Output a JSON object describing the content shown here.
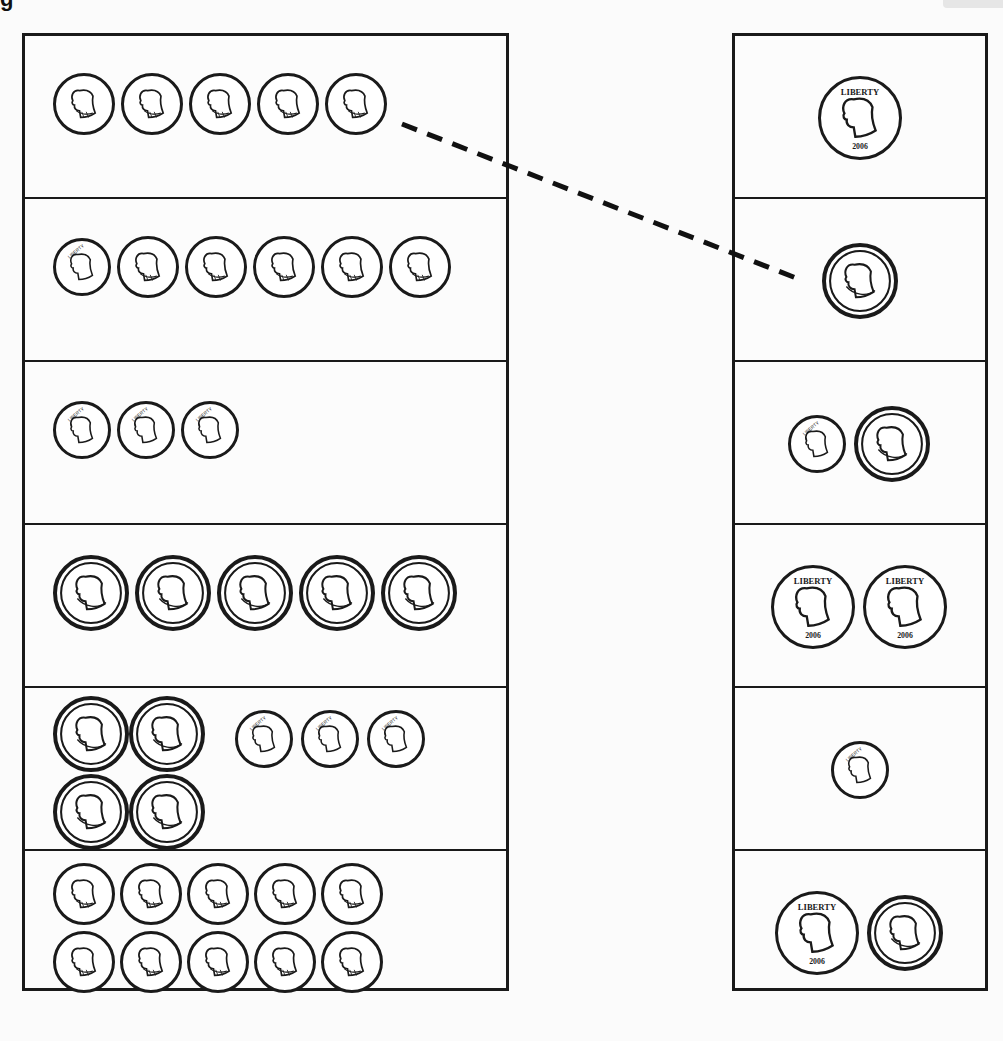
{
  "worksheet": {
    "title_fragment": "g",
    "instructions_visible": false
  },
  "coin_types": {
    "penny": {
      "icon": "penny-icon",
      "value_cents": 1,
      "diameter": 62
    },
    "nickel": {
      "icon": "nickel-icon",
      "value_cents": 5,
      "diameter": 76
    },
    "dime": {
      "icon": "dime-icon",
      "value_cents": 10,
      "diameter": 58
    },
    "quarter": {
      "icon": "quarter-icon",
      "value_cents": 25,
      "diameter": 84
    }
  },
  "left_column": [
    {
      "row": 1,
      "coins": [
        "penny",
        "penny",
        "penny",
        "penny",
        "penny"
      ],
      "total_cents": 5
    },
    {
      "row": 2,
      "coins": [
        "dime",
        "penny",
        "penny",
        "penny",
        "penny",
        "penny"
      ],
      "total_cents": 15
    },
    {
      "row": 3,
      "coins": [
        "dime",
        "dime",
        "dime"
      ],
      "total_cents": 30
    },
    {
      "row": 4,
      "coins": [
        "nickel",
        "nickel",
        "nickel",
        "nickel",
        "nickel"
      ],
      "total_cents": 25
    },
    {
      "row": 5,
      "coins": [
        "nickel",
        "nickel",
        "dime",
        "dime",
        "dime",
        "nickel",
        "nickel"
      ],
      "total_cents": 50
    },
    {
      "row": 6,
      "coins": [
        "penny",
        "penny",
        "penny",
        "penny",
        "penny",
        "penny",
        "penny",
        "penny",
        "penny",
        "penny"
      ],
      "total_cents": 10
    }
  ],
  "right_column": [
    {
      "row": 1,
      "coins": [
        "quarter"
      ],
      "total_cents": 25
    },
    {
      "row": 2,
      "coins": [
        "nickel"
      ],
      "total_cents": 5
    },
    {
      "row": 3,
      "coins": [
        "dime",
        "nickel"
      ],
      "total_cents": 15
    },
    {
      "row": 4,
      "coins": [
        "quarter",
        "quarter"
      ],
      "total_cents": 50
    },
    {
      "row": 5,
      "coins": [
        "dime"
      ],
      "total_cents": 10
    },
    {
      "row": 6,
      "coins": [
        "quarter",
        "nickel"
      ],
      "total_cents": 30
    }
  ],
  "matches_drawn": [
    {
      "from_left_row": 1,
      "to_right_row": 2,
      "style": "dashed"
    }
  ],
  "colors": {
    "ink": "#1a1a1a",
    "paper": "#fbfbfb"
  }
}
